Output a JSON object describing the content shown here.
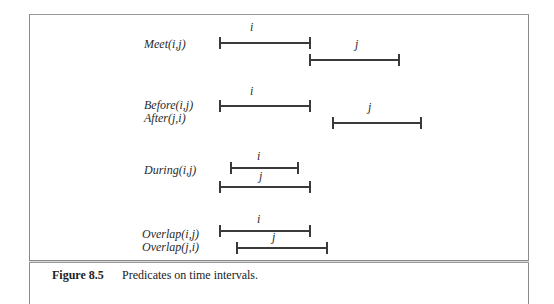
{
  "figure": {
    "number": "Figure 8.5",
    "caption": "Predicates on time intervals."
  },
  "groups": [
    {
      "name": "meet",
      "labels": [
        "Meet(i,j)"
      ],
      "intervals": [
        {
          "var": "i",
          "x1": 220,
          "x2": 310,
          "y": 42
        },
        {
          "var": "j",
          "x1": 310,
          "x2": 399,
          "y": 59
        }
      ]
    },
    {
      "name": "before-after",
      "labels": [
        "Before(i,j)",
        "After(j,i)"
      ],
      "intervals": [
        {
          "var": "i",
          "x1": 220,
          "x2": 310,
          "y": 105
        },
        {
          "var": "j",
          "x1": 333,
          "x2": 421,
          "y": 122
        }
      ]
    },
    {
      "name": "during",
      "labels": [
        "During(i,j)"
      ],
      "intervals": [
        {
          "var": "i",
          "x1": 231,
          "x2": 298,
          "y": 167
        },
        {
          "var": "j",
          "x1": 220,
          "x2": 310,
          "y": 186
        }
      ]
    },
    {
      "name": "overlap",
      "labels": [
        "Overlap(i,j)",
        "Overlap(j,i)"
      ],
      "intervals": [
        {
          "var": "i",
          "x1": 220,
          "x2": 310,
          "y": 230
        },
        {
          "var": "j",
          "x1": 237,
          "x2": 327,
          "y": 247
        }
      ]
    }
  ],
  "colors": {
    "line": "#3a3a3a",
    "frame": "#8a8a8a",
    "text": "#222222"
  }
}
